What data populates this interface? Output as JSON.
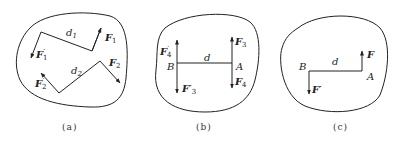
{
  "panels": [
    {
      "caption": "(a)",
      "labels": {
        "d1": "d",
        "d1_sub": "1",
        "d2": "d",
        "d2_sub": "2",
        "F1": "F",
        "F1_sub": "1",
        "F1p": "F",
        "F1p_sub": "1",
        "F1p_prime": "′",
        "F2": "F",
        "F2_sub": "2",
        "F2p": "F",
        "F2p_sub": "2",
        "F2p_prime": "′"
      }
    },
    {
      "caption": "(b)",
      "labels": {
        "d": "d",
        "A": "A",
        "B": "B",
        "F3": "F",
        "F3_sub": "3",
        "F4": "F",
        "F4_sub": "4",
        "F4p": "F",
        "F4p_sub": "4",
        "F4p_prime": "′",
        "F3p": "F′",
        "F3p_sub": "3"
      }
    },
    {
      "caption": "(c)",
      "labels": {
        "d": "d",
        "A": "A",
        "B": "B",
        "F": "F",
        "Fp": "F′"
      }
    }
  ]
}
